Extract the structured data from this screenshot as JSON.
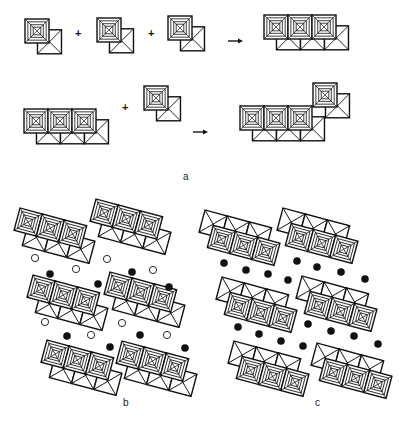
{
  "figure": {
    "panel_labels": {
      "a": "a",
      "b": "b",
      "c": "c"
    },
    "operators": {
      "plus": "+",
      "arrow": "→"
    },
    "colors": {
      "line": "#111111",
      "background": "#ffffff",
      "filled_ion": "#111111",
      "open_ion": "#ffffff"
    },
    "panel_a": {
      "description": "Assembly of edge-sharing octahedral dimer units into chains",
      "row1": {
        "units": [
          {
            "x": 25,
            "y": 19
          },
          {
            "x": 97,
            "y": 18
          },
          {
            "x": 168,
            "y": 16
          }
        ],
        "plus_signs": [
          {
            "x": 78,
            "y": 33
          },
          {
            "x": 151,
            "y": 33
          }
        ],
        "arrow": {
          "x1": 228,
          "x2": 243,
          "y": 41
        },
        "result_chain": {
          "x": 264,
          "y": 15,
          "units": 3
        }
      },
      "row2": {
        "chain": {
          "x": 24,
          "y": 109,
          "units": 3
        },
        "plus": {
          "x": 125,
          "y": 107
        },
        "unit": {
          "x": 144,
          "y": 86
        },
        "arrow": {
          "x1": 193,
          "x2": 208,
          "y": 132
        },
        "result_chain": {
          "x": 240,
          "y": 106,
          "units": 3
        },
        "result_extra_unit": {
          "x": 313,
          "y": 83
        }
      },
      "label_pos": {
        "x": 183,
        "y": 180
      }
    },
    "panel_b": {
      "description": "Layered chains with interlayer cations (open and filled circles)",
      "chains": [
        {
          "x": 20,
          "y": 208
        },
        {
          "x": 96,
          "y": 199
        },
        {
          "x": 33,
          "y": 275
        },
        {
          "x": 110,
          "y": 272
        },
        {
          "x": 47,
          "y": 340
        },
        {
          "x": 122,
          "y": 341
        }
      ],
      "open_circles": [
        [
          35,
          258
        ],
        [
          76,
          269
        ],
        [
          107,
          259
        ],
        [
          153,
          270
        ],
        [
          45,
          322
        ],
        [
          91,
          335
        ],
        [
          122,
          323
        ],
        [
          167,
          335
        ]
      ],
      "filled_circles": [
        [
          50,
          274
        ],
        [
          98,
          284
        ],
        [
          132,
          272
        ],
        [
          169,
          287
        ],
        [
          67,
          336
        ],
        [
          110,
          347
        ],
        [
          140,
          335
        ],
        [
          185,
          348
        ]
      ],
      "label_pos": {
        "x": 123,
        "y": 406
      }
    },
    "panel_c": {
      "description": "Layered chains with filled interlayer cations only",
      "chains": [
        {
          "x": 205,
          "y": 210
        },
        {
          "x": 283,
          "y": 208
        },
        {
          "x": 222,
          "y": 277
        },
        {
          "x": 302,
          "y": 276
        },
        {
          "x": 234,
          "y": 341
        },
        {
          "x": 317,
          "y": 343
        }
      ],
      "filled_circles": [
        [
          224,
          263
        ],
        [
          246,
          270
        ],
        [
          268,
          274
        ],
        [
          288,
          280
        ],
        [
          297,
          261
        ],
        [
          317,
          267
        ],
        [
          341,
          272
        ],
        [
          365,
          279
        ],
        [
          238,
          327
        ],
        [
          259,
          334
        ],
        [
          281,
          341
        ],
        [
          303,
          346
        ],
        [
          308,
          324
        ],
        [
          331,
          331
        ],
        [
          354,
          336
        ],
        [
          378,
          344
        ]
      ],
      "label_pos": {
        "x": 315,
        "y": 406
      }
    }
  }
}
